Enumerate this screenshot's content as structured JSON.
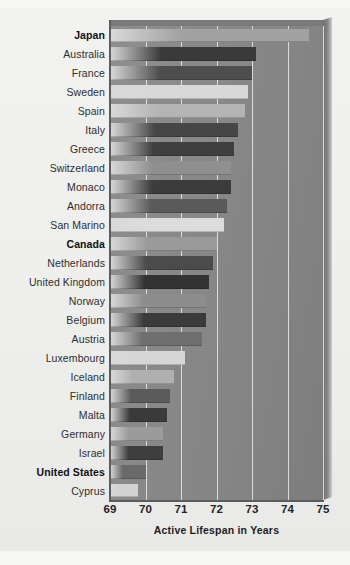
{
  "chart_data": {
    "type": "bar",
    "orientation": "horizontal",
    "title": "",
    "xlabel": "Active Lifespan in Years",
    "ylabel": "",
    "xlim": [
      69,
      75
    ],
    "ylim": null,
    "grid": true,
    "legend": false,
    "xticks": [
      "69",
      "70",
      "71",
      "72",
      "73",
      "74",
      "75"
    ],
    "xtick_values": [
      69,
      70,
      71,
      72,
      73,
      74,
      75
    ],
    "categories": [
      "Japan",
      "Australia",
      "France",
      "Sweden",
      "Spain",
      "Italy",
      "Greece",
      "Switzerland",
      "Monaco",
      "Andorra",
      "San Marino",
      "Canada",
      "Netherlands",
      "United Kingdom",
      "Norway",
      "Belgium",
      "Austria",
      "Luxembourg",
      "Iceland",
      "Finland",
      "Malta",
      "Germany",
      "Israel",
      "United States",
      "Cyprus"
    ],
    "values": [
      74.6,
      73.1,
      73.0,
      72.9,
      72.8,
      72.6,
      72.5,
      72.4,
      72.4,
      72.3,
      72.2,
      72.0,
      71.9,
      71.8,
      71.7,
      71.7,
      71.6,
      71.1,
      70.8,
      70.7,
      70.6,
      70.5,
      70.5,
      70.0,
      69.8
    ],
    "highlighted": [
      "Japan",
      "Canada",
      "United States"
    ],
    "bar_shades": [
      "#a2a2a2",
      "#3a3a3a",
      "#4e4e4e",
      "#d8d8d8",
      "#b4b4b4",
      "#464646",
      "#3f3f3f",
      "#8f8f8f",
      "#3c3c3c",
      "#5a5a5a",
      "#dcdcdc",
      "#9a9a9a",
      "#4b4b4b",
      "#333333",
      "#8d8d8d",
      "#3b3b3b",
      "#6f6f6f",
      "#d6d6d6",
      "#b0b0b0",
      "#5b5b5b",
      "#3a3a3a",
      "#9b9b9b",
      "#3e3e3e",
      "#6a6a6a",
      "#d2d2d2"
    ],
    "colors": {
      "plot_background": "#878787",
      "page_background": "#eeeeed",
      "gridline": "#f5f5f5",
      "axis": "#5d5d5d",
      "label_text": "#2e2e2e",
      "tick_text": "#232323"
    }
  }
}
